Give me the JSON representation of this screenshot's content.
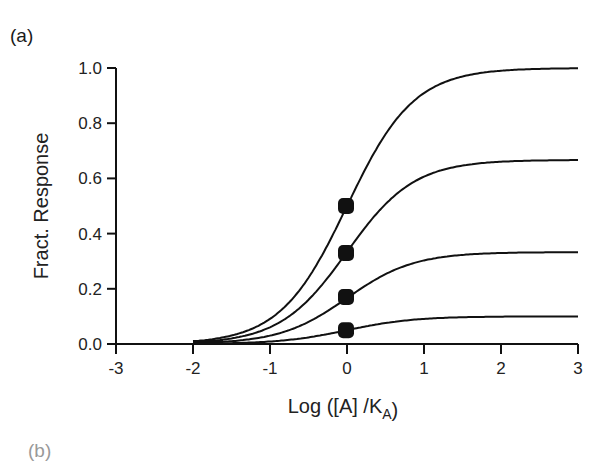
{
  "panel": {
    "label": "(a)",
    "next_label_cropped": "(b)"
  },
  "chart_data": {
    "type": "line",
    "title": "",
    "xlabel": "Log ([A] /K_A)",
    "ylabel": "Fract. Response",
    "xlim": [
      -3,
      3
    ],
    "ylim": [
      0,
      1.0
    ],
    "xticks": [
      "-3",
      "-2",
      "-1",
      "0",
      "1",
      "2",
      "3"
    ],
    "yticks": [
      "0.0",
      "0.2",
      "0.4",
      "0.6",
      "0.8",
      "1.0"
    ],
    "grid": false,
    "legend": null,
    "curve_x_range": [
      -2,
      3
    ],
    "series": [
      {
        "name": "curve-1",
        "emax": 1.0,
        "log_ec50": 0,
        "marker": {
          "x": 0,
          "y": 0.5
        }
      },
      {
        "name": "curve-2",
        "emax": 0.667,
        "log_ec50": 0,
        "marker": {
          "x": 0,
          "y": 0.33
        }
      },
      {
        "name": "curve-3",
        "emax": 0.333,
        "log_ec50": 0,
        "marker": {
          "x": 0,
          "y": 0.17
        }
      },
      {
        "name": "curve-4",
        "emax": 0.1,
        "log_ec50": 0,
        "marker": {
          "x": 0,
          "y": 0.05
        }
      }
    ],
    "sample_points": {
      "x": [
        -2,
        -1,
        0,
        1,
        2,
        3
      ],
      "curve-1": [
        0.01,
        0.09,
        0.5,
        0.91,
        0.99,
        1.0
      ],
      "curve-2": [
        0.007,
        0.06,
        0.33,
        0.61,
        0.66,
        0.67
      ],
      "curve-3": [
        0.003,
        0.03,
        0.17,
        0.3,
        0.33,
        0.33
      ],
      "curve-4": [
        0.001,
        0.009,
        0.05,
        0.09,
        0.099,
        0.1
      ]
    }
  }
}
